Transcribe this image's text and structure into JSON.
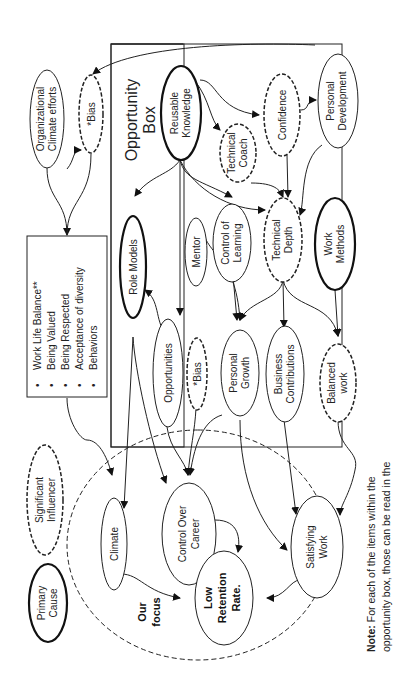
{
  "diagram": {
    "opportunity_box": {
      "title_line1": "Opportunity",
      "title_line2": "Box"
    },
    "nodes": {
      "org_climate": {
        "line1": "Organizational",
        "line2": "Climate efforts",
        "style": "normal"
      },
      "bias_top": {
        "line1": "*Bias",
        "style": "dashed"
      },
      "reusable_knowledge": {
        "line1": "Reusable",
        "line2": "Knowledge",
        "style": "bold"
      },
      "technical_coach": {
        "line1": "Technical",
        "line2": "Coach",
        "style": "dashed"
      },
      "confidence": {
        "line1": "Confidence",
        "style": "dashed"
      },
      "personal_development": {
        "line1": "Personal",
        "line2": "Development",
        "style": "normal"
      },
      "role_models": {
        "line1": "Role Models",
        "style": "bold"
      },
      "mentor": {
        "line1": "Mentor",
        "style": "normal"
      },
      "control_of_learning": {
        "line1": "Control of",
        "line2": "Learning",
        "style": "normal"
      },
      "technical_depth": {
        "line1": "Technical",
        "line2": "Depth",
        "style": "dashed"
      },
      "work_methods": {
        "line1": "Work",
        "line2": "Methods",
        "style": "bold"
      },
      "opportunities": {
        "line1": "Opportunities",
        "style": "normal"
      },
      "bias_mid": {
        "line1": "*Bias",
        "style": "dashed"
      },
      "personal_growth": {
        "line1": "Personal",
        "line2": "Growth",
        "style": "normal"
      },
      "business_contributions": {
        "line1": "Business",
        "line2": "Contributions",
        "style": "normal"
      },
      "balanced_work": {
        "line1": "Balanced",
        "line2": "work",
        "style": "dashed"
      },
      "climate": {
        "line1": "Climate",
        "style": "normal"
      },
      "control_over_career": {
        "line1": "Control Over",
        "line2": "Career",
        "style": "normal"
      },
      "satisfying_work": {
        "line1": "Satisfying",
        "line2": "Work",
        "style": "normal"
      },
      "low_retention": {
        "line1": "Low",
        "line2": "Retention",
        "line3": "Rate.",
        "style": "bold-text"
      }
    },
    "climate_box": {
      "items": [
        "Work Life Balance**",
        "Being Valued",
        "Being Respected",
        "Acceptance of diversity",
        "Behaviors"
      ],
      "bullet": "•"
    },
    "focus_label": {
      "line1": "Our",
      "line2": "focus"
    },
    "legend": {
      "significant_influencer": {
        "line1": "Significant",
        "line2": "Influencer"
      },
      "primary_cause": {
        "line1": "Primary",
        "line2": "Cause"
      }
    },
    "note": {
      "bold": "Note:",
      "line1_rest": " For each of the items within the",
      "line2": "opportunity box, those can be read in the"
    }
  }
}
